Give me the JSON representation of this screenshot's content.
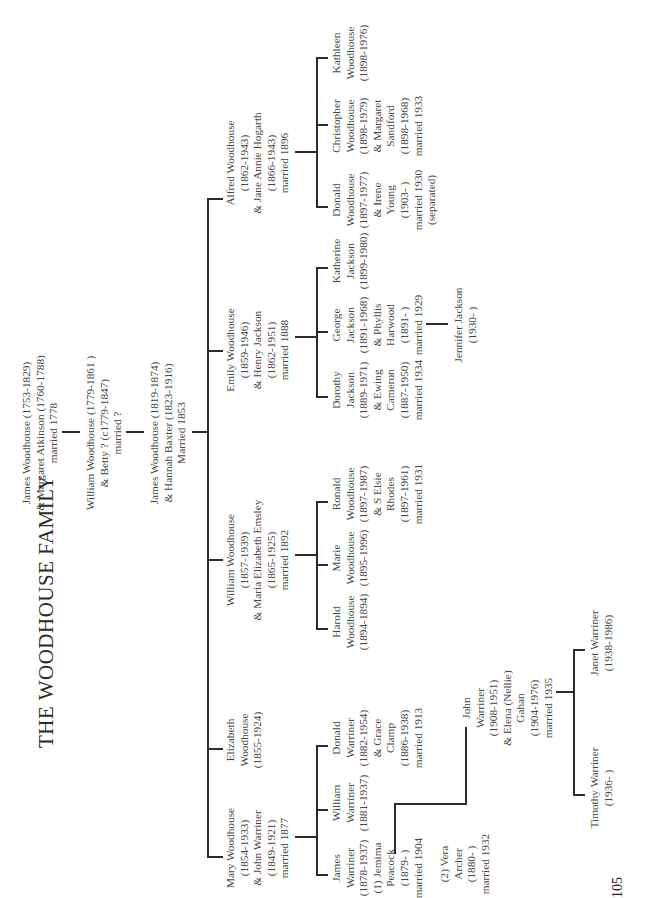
{
  "title": "THE WOODHOUSE FAMILY",
  "page_number": "105",
  "generations": {
    "g1": {
      "lines": [
        "James Woodhouse (1753-1829)",
        "& Margaret Atkinson (1760-1788)",
        "married 1778"
      ]
    },
    "g2": {
      "lines": [
        "William Woodhouse (1779-1861 )",
        "& Betty ? (c1779-1847)",
        "married ?"
      ]
    },
    "g3": {
      "lines": [
        "James Woodhouse (1819-1874)",
        "& Hannah Baxter (1823-1916)",
        "Married 1853"
      ]
    }
  },
  "children": {
    "mary": {
      "lines": [
        "Mary Woodhouse",
        "(1854-1933)",
        "& John Warriner",
        "(1849-1921)",
        "married 1877"
      ]
    },
    "elizabeth": {
      "lines": [
        "Elizabeth",
        "Woodhouse",
        "(1855-1924)"
      ]
    },
    "william": {
      "lines": [
        "William Woodhouse",
        "(1857-1939)",
        "& Maria Elizabeth Emsley",
        "(1865-1925)",
        "married 1892"
      ]
    },
    "emily": {
      "lines": [
        "Emily Woodhouse",
        "(1859-1946)",
        "& Henry Jackson",
        "(1862-1951)",
        "married 1888"
      ]
    },
    "alfred": {
      "lines": [
        "Alfred Woodhouse",
        "(1862-1943)",
        "& Jane Annie Hogarth",
        "(1866-1943)",
        "married 1896"
      ]
    }
  },
  "grandchildren": {
    "james_w": {
      "lines": [
        "James",
        "Warriner",
        "(1878-1937)",
        "(1) Jemima",
        "Peacock",
        "(1879- )",
        "married 1904"
      ]
    },
    "james_w_2": {
      "lines": [
        "(2) Vera",
        "Archer",
        "(1880- )",
        "married 1932"
      ]
    },
    "william_w": {
      "lines": [
        "William",
        "Warriner",
        "(1881-1937)"
      ]
    },
    "donald_w": {
      "lines": [
        "Donald",
        "Warriner",
        "(1882-1954)",
        "& Grace",
        "Clamp",
        "(1886-1938)",
        "married 1913"
      ]
    },
    "harold": {
      "lines": [
        "Harold",
        "Woodhouse",
        "(1894-1894)"
      ]
    },
    "marie": {
      "lines": [
        "Marie",
        "Woodhouse",
        "(1895-1996)"
      ]
    },
    "ronald": {
      "lines": [
        "Ronald",
        "Woodhouse",
        "(1897-1987)",
        "& S Elsie",
        "Rhodes",
        "(1897-1961)",
        "married 1931"
      ]
    },
    "dorothy": {
      "lines": [
        "Dorothy",
        "Jackson",
        "(1889-1971)",
        "& Ewing",
        "Cameron",
        "(1887-1950)",
        "married 1934"
      ]
    },
    "george": {
      "lines": [
        "George",
        "Jackson",
        "(1891-1968)",
        "& Phyllis",
        "Harwood",
        "(1891- )",
        "married 1929"
      ]
    },
    "katherine": {
      "lines": [
        "Katherine",
        "Jackson",
        "(1899-1980)"
      ]
    },
    "donald_wh": {
      "lines": [
        "Donald",
        "Woodhouse",
        "(1897-1977)",
        "& Irene",
        "Young",
        "(1903- )",
        "married 1930",
        "(separated)"
      ]
    },
    "christopher": {
      "lines": [
        "Christopher",
        "Woodhouse",
        "(1898-1979)",
        "& Margaret",
        "Sandford",
        "(1898-1968)",
        "married 1933"
      ]
    },
    "kathleen": {
      "lines": [
        "Kathleen",
        "Woodhouse",
        "(1898-1976)"
      ]
    }
  },
  "great_grandchildren": {
    "john_w": {
      "lines": [
        "John",
        "Warriner",
        "(1908-1951)",
        "& Elena (Nellie)",
        "Gahan",
        "(1904-1976)",
        "married 1935"
      ]
    },
    "jennifer": {
      "lines": [
        "Jennifer Jackson",
        "(1930- )"
      ]
    }
  },
  "great_great_grandchildren": {
    "timothy": {
      "lines": [
        "Timothy Warriner",
        "(1936- )"
      ]
    },
    "janet": {
      "lines": [
        "Janet Warriner",
        "(1938-1986)"
      ]
    }
  }
}
